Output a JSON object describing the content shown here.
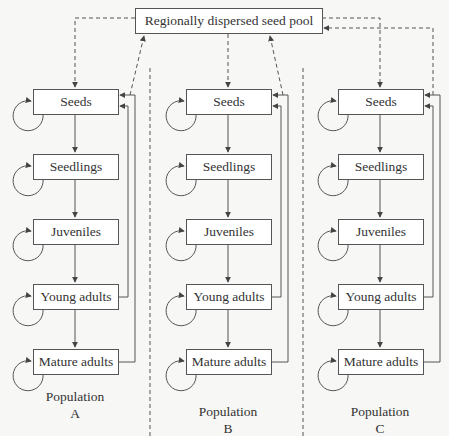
{
  "diagram": {
    "pool": {
      "label": "Regionally dispersed seed pool"
    },
    "stages": [
      "Seeds",
      "Seedlings",
      "Juveniles",
      "Young adults",
      "Mature adults"
    ],
    "populations": [
      {
        "name": "Population",
        "letter": "A",
        "stages": [
          "Seeds",
          "Seedlings",
          "Juveniles",
          "Young adults",
          "Mature adults"
        ]
      },
      {
        "name": "Population",
        "letter": "B",
        "stages": [
          "Seeds",
          "Seedlings",
          "Juveniles",
          "Young adults",
          "Mature adults"
        ]
      },
      {
        "name": "Population",
        "letter": "C",
        "stages": [
          "Seeds",
          "Seedlings",
          "Juveniles",
          "Young adults",
          "Mature adults"
        ]
      }
    ],
    "edges": {
      "solid": "stage transitions (stage -> next stage), self-loops on each stage, reproduction from Young adults and Mature adults back to Seeds",
      "dashed": "pool -> Seeds of A, B, C (dispersal in); Seeds/reproduction of A, B, C -> pool (dispersal out)"
    },
    "colors": {
      "line": "#555555",
      "box_fill": "#ffffff",
      "background": "#f7f7f5"
    }
  }
}
